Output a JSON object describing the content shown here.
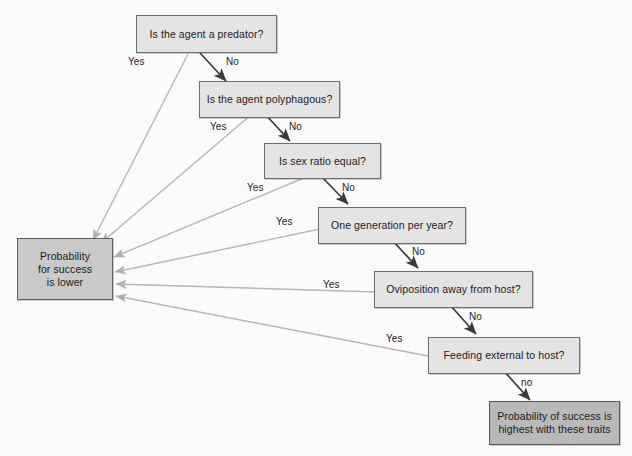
{
  "diagram": {
    "background_color": "#fbfbfc",
    "node_fill": "#e4e4e4",
    "terminal_low_fill": "#c9c9c9",
    "terminal_high_fill": "#b9b9b9",
    "node_border_color": "#6d6d6d",
    "yes_edge_color": "#b3b3b3",
    "no_edge_color": "#3a3a3a"
  },
  "nodes": {
    "q1": "Is the agent a predator?",
    "q2": "Is the agent polyphagous?",
    "q3": "Is sex ratio equal?",
    "q4": "One generation per year?",
    "q5": "Oviposition away from host?",
    "q6": "Feeding external to host?",
    "outcome_low_line1": "Probability",
    "outcome_low_line2": "for success",
    "outcome_low_line3": "is lower",
    "outcome_high_line1": "Probability of success is",
    "outcome_high_line2": "highest with these traits"
  },
  "edge_labels": {
    "q1_yes": "Yes",
    "q1_no": "No",
    "q2_yes": "Yes",
    "q2_no": "No",
    "q3_yes": "Yes",
    "q3_no": "No",
    "q4_yes": "Yes",
    "q4_no": "No",
    "q5_yes": "Yes",
    "q5_no": "No",
    "q6_yes": "Yes",
    "q6_no": "no"
  }
}
